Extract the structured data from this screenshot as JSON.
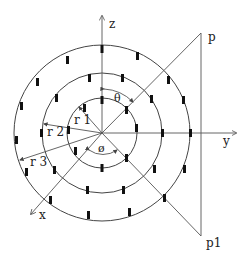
{
  "diagram": {
    "type": "spherical-coordinate-array",
    "center": [
      102,
      133
    ],
    "axes": {
      "z": {
        "label": "z"
      },
      "y": {
        "label": "y"
      },
      "x": {
        "label": "x"
      }
    },
    "points": {
      "p": {
        "label": "p"
      },
      "p1": {
        "label": "p1"
      }
    },
    "radii": [
      {
        "label": "r 1",
        "r": 35
      },
      {
        "label": "r 2",
        "r": 60
      },
      {
        "label": "r 3",
        "r": 88
      }
    ],
    "angles": {
      "theta": {
        "label": "θ"
      },
      "phi": {
        "label": "ø"
      }
    },
    "colors": {
      "line": "#555555",
      "ring": "#444444",
      "element": "#111111",
      "text": "#222222"
    }
  }
}
